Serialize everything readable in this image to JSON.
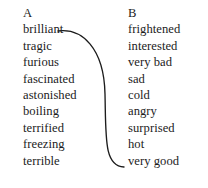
{
  "exercise": {
    "type": "matching-columns",
    "background_color": "#ffffff",
    "text_color": "#1c1c1c"
  },
  "column_a": {
    "heading": "A",
    "items": [
      {
        "label": "brilliant"
      },
      {
        "label": "tragic"
      },
      {
        "label": "furious"
      },
      {
        "label": "fascinated"
      },
      {
        "label": "astonished"
      },
      {
        "label": "boiling"
      },
      {
        "label": "terrified"
      },
      {
        "label": "freezing"
      },
      {
        "label": "terrible"
      }
    ]
  },
  "column_b": {
    "heading": "B",
    "items": [
      {
        "label": "frightened"
      },
      {
        "label": "interested"
      },
      {
        "label": "very bad"
      },
      {
        "label": "sad"
      },
      {
        "label": "cold"
      },
      {
        "label": "angry"
      },
      {
        "label": "surprised"
      },
      {
        "label": "hot"
      },
      {
        "label": "very good"
      }
    ]
  },
  "connections": [
    {
      "from": "brilliant",
      "to": "very good",
      "stroke_color": "#1c1c1c",
      "path": "M 58 31 C 82 28 104 48 105 94 C 106 138 104 166 124 167"
    }
  ]
}
